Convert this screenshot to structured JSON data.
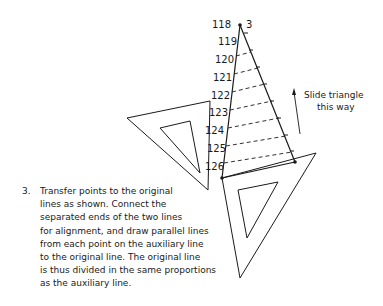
{
  "figure": {
    "scale_labels": [
      "118",
      "119",
      "120",
      "121",
      "122",
      "123",
      "124",
      "125",
      "126"
    ],
    "top_label_suffix": "3",
    "slide_note": [
      "Slide triangle",
      "this way"
    ],
    "caption": {
      "number": "3.",
      "lines": [
        "Transfer points to the original",
        "lines as shown. Connect the",
        "separated ends of the two lines",
        "for alignment, and draw parallel lines",
        "from each point on the auxiliary line",
        "to the original line. The original line",
        "is thus divided in the same proportions",
        "as the auxiliary line."
      ]
    },
    "colors": {
      "ink": "#1a1a1a",
      "background": "#ffffff"
    }
  }
}
